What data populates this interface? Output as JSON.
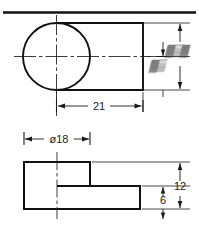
{
  "drawing": {
    "title": "Two-view orthographic engineering drawing",
    "sheet_rule": "horizontal border rule across top of sheet",
    "line_color": "#111111",
    "centerline_color": "#1a1a1a",
    "dimension_color": "#1a1a1a",
    "background_color": "#ffffff",
    "views": [
      {
        "name": "top-view",
        "description": "Circle overlapping a rectangle, with horizontal and vertical centerlines",
        "features": [
          "circle",
          "rectangle",
          "horizontal-centerline",
          "vertical-centerline"
        ]
      },
      {
        "name": "front-view",
        "description": "Stepped L-shaped profile outline with vertical centerline",
        "features": [
          "stepped-profile",
          "vertical-centerline"
        ]
      }
    ],
    "dimensions": [
      {
        "id": "dim-21",
        "label": "21",
        "view": "top-view",
        "orientation": "horizontal",
        "legible": true
      },
      {
        "id": "dim-top-outer",
        "label": "",
        "view": "top-view",
        "orientation": "vertical",
        "legible": false,
        "note": "value obscured / illegible in source image"
      },
      {
        "id": "dim-top-inner",
        "label": "",
        "view": "top-view",
        "orientation": "vertical",
        "legible": false,
        "note": "value obscured / illegible in source image"
      },
      {
        "id": "dim-diameter-18",
        "label": "ø18",
        "view": "front-view",
        "orientation": "horizontal",
        "legible": true
      },
      {
        "id": "dim-12",
        "label": "12",
        "view": "front-view",
        "orientation": "vertical",
        "legible": true
      },
      {
        "id": "dim-6",
        "label": "6",
        "view": "front-view",
        "orientation": "vertical",
        "legible": true
      }
    ]
  }
}
